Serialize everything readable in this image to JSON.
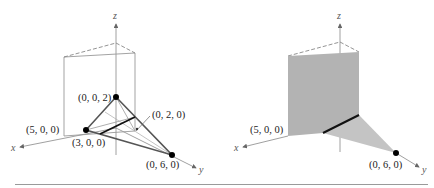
{
  "figure": {
    "left": {
      "axes": {
        "x": "x",
        "y": "y",
        "z": "z"
      },
      "points": {
        "p002": "(0, 0, 2)",
        "p500": "(5, 0, 0)",
        "p300": "(3, 0, 0)",
        "p020": "(0, 2, 0)",
        "p060": "(0, 6, 0)"
      }
    },
    "right": {
      "axes": {
        "x": "x",
        "y": "y",
        "z": "z"
      },
      "points": {
        "p500": "(5, 0, 0)",
        "p060": "(0, 6, 0)"
      }
    },
    "colors": {
      "line": "#555555",
      "thin": "#8a8a8a",
      "bold": "#111111",
      "plane_fill": "#b3b3b3",
      "point": "#000000"
    }
  }
}
